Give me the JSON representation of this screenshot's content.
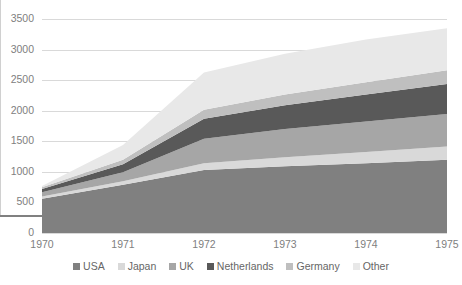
{
  "chart_data": {
    "type": "area",
    "stacked": true,
    "title": "",
    "xlabel": "",
    "ylabel": "",
    "x": [
      1970,
      1971,
      1972,
      1973,
      1974,
      1975
    ],
    "categories": [
      "1970",
      "1971",
      "1972",
      "1973",
      "1974",
      "1975"
    ],
    "xtick_labels": [
      "1970",
      "1971",
      "1972",
      "1973",
      "1974",
      "1975"
    ],
    "ytick_labels": [
      "0",
      "500",
      "1000",
      "1500",
      "2000",
      "2500",
      "3000",
      "3500"
    ],
    "ytick_values": [
      0,
      500,
      1000,
      1500,
      2000,
      2500,
      3000,
      3500
    ],
    "ylim": [
      0,
      3500
    ],
    "xlim": [
      1970,
      1975
    ],
    "grid": "horizontal",
    "legend_position": "bottom",
    "series": [
      {
        "name": "USA",
        "color": "#808080",
        "values": [
          560,
          790,
          1030,
          1090,
          1140,
          1200
        ]
      },
      {
        "name": "Japan",
        "color": "#d9d9d9",
        "values": [
          35,
          55,
          110,
          150,
          185,
          215
        ]
      },
      {
        "name": "UK",
        "color": "#a6a6a6",
        "values": [
          70,
          150,
          400,
          460,
          500,
          530
        ]
      },
      {
        "name": "Netherlands",
        "color": "#595959",
        "values": [
          55,
          130,
          330,
          390,
          440,
          490
        ]
      },
      {
        "name": "Germany",
        "color": "#bfbfbf",
        "values": [
          30,
          75,
          145,
          175,
          200,
          225
        ]
      },
      {
        "name": "Other",
        "color": "#e8e8e8",
        "values": [
          20,
          240,
          610,
          665,
          700,
          690
        ]
      }
    ],
    "totals": [
      770,
      1440,
      2625,
      2930,
      3165,
      3350
    ]
  },
  "legend": {
    "items": [
      {
        "label": "USA",
        "color": "#808080"
      },
      {
        "label": "Japan",
        "color": "#d9d9d9"
      },
      {
        "label": "UK",
        "color": "#a6a6a6"
      },
      {
        "label": "Netherlands",
        "color": "#595959"
      },
      {
        "label": "Germany",
        "color": "#bfbfbf"
      },
      {
        "label": "Other",
        "color": "#e8e8e8"
      }
    ]
  },
  "axis": {
    "gridline_color": "#d9d9d9",
    "axis_color": "#808080",
    "tick_text_color": "#808080"
  }
}
